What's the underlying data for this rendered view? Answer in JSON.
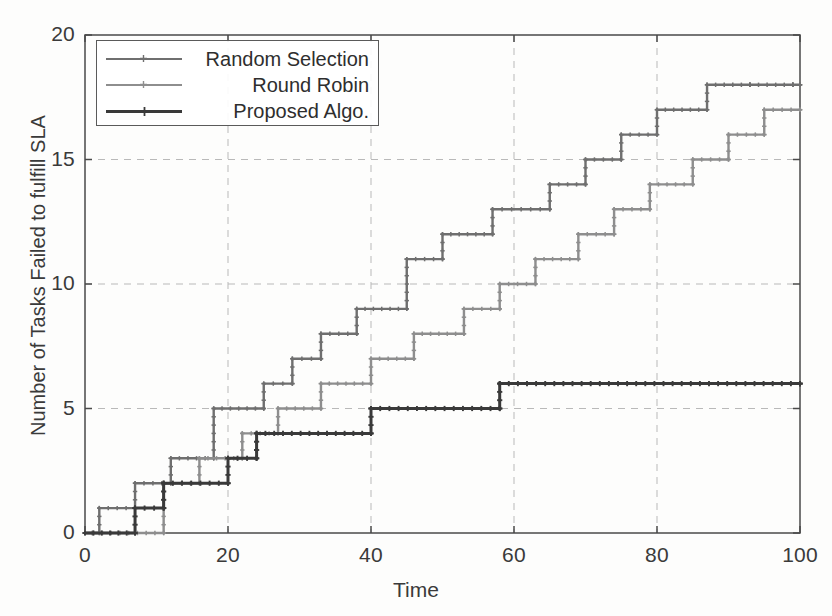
{
  "chart_data": {
    "type": "line",
    "title": "",
    "xlabel": "Time",
    "ylabel": "Number of Tasks Failed to fulfill SLA",
    "xlim": [
      0,
      100
    ],
    "ylim": [
      0,
      20
    ],
    "xticks": [
      0,
      20,
      40,
      60,
      80,
      100
    ],
    "yticks": [
      0,
      5,
      10,
      15,
      20
    ],
    "grid": true,
    "legend_position": "upper left",
    "step_style": "post",
    "series": [
      {
        "name": "Random Selection",
        "color": "#6f6f6f",
        "x": [
          0,
          2,
          7,
          12,
          18,
          25,
          29,
          33,
          38,
          45,
          50,
          57,
          65,
          70,
          75,
          80,
          87,
          93,
          99,
          100
        ],
        "y": [
          0,
          1,
          2,
          3,
          5,
          6,
          7,
          8,
          9,
          11,
          12,
          13,
          14,
          15,
          16,
          17,
          18,
          18,
          18,
          18
        ]
      },
      {
        "name": "Round Robin",
        "color": "#8e8e8e",
        "x": [
          0,
          11,
          16,
          22,
          27,
          33,
          40,
          46,
          53,
          58,
          63,
          69,
          74,
          79,
          85,
          90,
          95,
          100
        ],
        "y": [
          0,
          2,
          3,
          4,
          5,
          6,
          7,
          8,
          9,
          10,
          11,
          12,
          13,
          14,
          15,
          16,
          17,
          17
        ]
      },
      {
        "name": "Proposed Algo.",
        "color": "#3a3a3a",
        "x": [
          0,
          7,
          11,
          20,
          24,
          40,
          58,
          100
        ],
        "y": [
          0,
          1,
          2,
          3,
          4,
          5,
          6,
          6
        ]
      }
    ]
  },
  "legend": {
    "items": [
      {
        "label": "Random Selection"
      },
      {
        "label": "Round Robin"
      },
      {
        "label": "Proposed Algo."
      }
    ]
  },
  "axes": {
    "y_tick_labels": [
      "20",
      "15",
      "10",
      "5",
      "0"
    ],
    "x_tick_labels": [
      "0",
      "20",
      "40",
      "60",
      "80",
      "100"
    ],
    "x_axis_title": "Time",
    "y_axis_title": "Number of Tasks Failed to fulfill SLA"
  },
  "colors": {
    "axis": "#4a4a4a",
    "grid": "#b9b9b9",
    "background": "#fdfdfc"
  }
}
